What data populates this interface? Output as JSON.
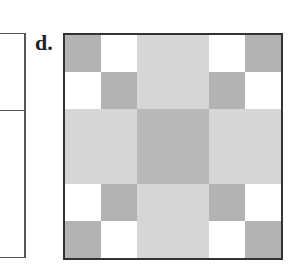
{
  "figure": {
    "label": "d.",
    "colors": {
      "D": "#b3b3b3",
      "W": "#ffffff",
      "L": "#d6d6d6",
      "M": "#b8b8b8"
    },
    "grid": {
      "rows": 6,
      "cols": 6,
      "cells": [
        [
          "D",
          "W",
          "L",
          "L",
          "W",
          "D"
        ],
        [
          "W",
          "D",
          "L",
          "L",
          "D",
          "W"
        ],
        [
          "L",
          "L",
          "M",
          "M",
          "L",
          "L"
        ],
        [
          "L",
          "L",
          "M",
          "M",
          "L",
          "L"
        ],
        [
          "W",
          "D",
          "L",
          "L",
          "D",
          "W"
        ],
        [
          "D",
          "W",
          "L",
          "L",
          "W",
          "D"
        ]
      ]
    }
  }
}
